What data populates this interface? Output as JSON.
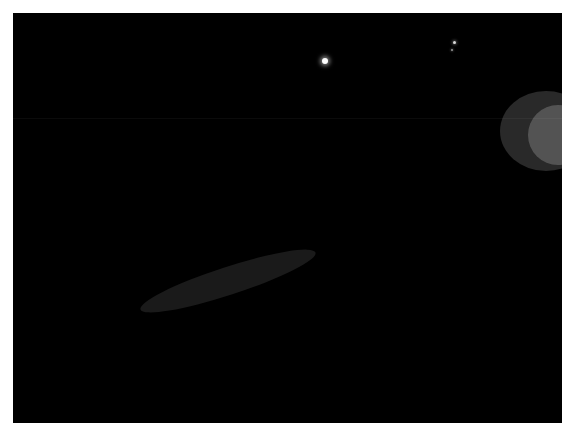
{
  "image": {
    "subject": "Saturn's rings",
    "view": "oblique wide-angle view of the ring plane from above, ansa at left",
    "background_color": "#000000",
    "border_color": "#ffffff",
    "border_width_px": 13,
    "canvas": {
      "width": 574,
      "height": 438
    },
    "photo": {
      "x": 13,
      "y": 13,
      "width": 549,
      "height": 410
    }
  },
  "chart_data": {
    "type": "scatter",
    "xlabel": "",
    "ylabel": "",
    "grid": false,
    "legend": false,
    "geometry": {
      "note": "Rings rendered as nested ellipses sharing a common center far to the right of frame; only the left ansa and both arms are visible.",
      "center_x": 1015,
      "center_y": -95,
      "rotation_deg": -20.5,
      "aspect_ratio": 0.232
    },
    "categories": [
      "C ring (inner, faint banded)",
      "B ring (bright, broad)",
      "Cassini Division (dark gap)",
      "A ring (mid-bright)",
      "Encke Gap (narrow dark line)",
      "A ring outer edge"
    ],
    "values": [
      0.18,
      0.95,
      0.12,
      0.55,
      0.04,
      0.45
    ],
    "ylim": [
      0,
      1
    ],
    "annotations": [
      {
        "label": "moon-1",
        "x": 325,
        "y": 61,
        "brightness": 1.0,
        "size_px": 6
      },
      {
        "label": "moon-2",
        "x": 454,
        "y": 42,
        "brightness": 0.85,
        "size_px": 3
      },
      {
        "label": "moon-3",
        "x": 452,
        "y": 50,
        "brightness": 0.6,
        "size_px": 2
      }
    ]
  },
  "features": {
    "moons": [
      {
        "name": "bright-moon",
        "x": 325,
        "y": 61,
        "diameter": 6
      },
      {
        "name": "faint-moon-upper",
        "x": 454,
        "y": 42,
        "diameter": 3
      },
      {
        "name": "faint-moon-lower",
        "x": 452,
        "y": 50,
        "diameter": 2
      }
    ],
    "seam_line": {
      "y": 118,
      "opacity": 0.045
    },
    "ring_labels": [
      "C ring",
      "B ring",
      "Cassini Division",
      "A ring",
      "Encke Gap"
    ]
  },
  "palette": {
    "space": "#000000",
    "frame": "#ffffff",
    "ring_bright": "#f2f1ee",
    "ring_mid": "#b9b7b2",
    "ring_dim": "#6e6c68",
    "ring_faint": "#3a3937",
    "gap_dark": "#050505"
  }
}
